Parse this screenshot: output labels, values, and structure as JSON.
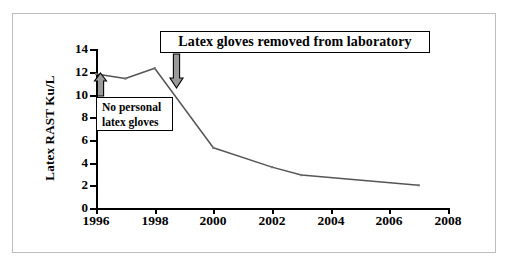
{
  "figure": {
    "background_color": "#ffffff",
    "frame_color": "#bdbdbd",
    "line_color": "#555555",
    "text_color": "#000000"
  },
  "annotations": {
    "removed": {
      "text": "Latex gloves removed from laboratory",
      "arrow": "down-arrow-icon",
      "year": 1999
    },
    "no_personal": {
      "line1": "No personal",
      "line2": "latex gloves",
      "arrow": "up-arrow-icon",
      "year": 1996
    }
  },
  "chart_data": {
    "type": "line",
    "title": "",
    "xlabel": "",
    "ylabel": "Latex RAST Ku/L",
    "x": [
      1996,
      1997,
      1998,
      2000,
      2002,
      2003,
      2007
    ],
    "values": [
      11.8,
      11.4,
      12.3,
      5.3,
      3.6,
      2.9,
      2.0
    ],
    "series": [
      {
        "name": "Latex RAST",
        "x": [
          1996,
          1997,
          1998,
          2000,
          2002,
          2003,
          2007
        ],
        "values": [
          11.8,
          11.4,
          12.3,
          5.3,
          3.6,
          2.9,
          2.0
        ]
      }
    ],
    "xlim": [
      1996,
      2008
    ],
    "ylim": [
      0,
      14
    ],
    "xticks": [
      1996,
      1998,
      2000,
      2002,
      2004,
      2006,
      2008
    ],
    "xtick_labels": [
      "1996",
      "1998",
      "2000",
      "2002",
      "2004",
      "2006",
      "2008"
    ],
    "yticks": [
      0,
      2,
      4,
      6,
      8,
      10,
      12,
      14
    ],
    "ytick_labels": [
      "0",
      "2",
      "4",
      "6",
      "8",
      "10",
      "12",
      "14"
    ],
    "grid": false,
    "legend": false,
    "marker": "small-tick",
    "annotations": [
      {
        "text": "Latex gloves removed from laboratory",
        "x": 1999,
        "y": 14
      },
      {
        "text": "No personal latex gloves",
        "x": 1996,
        "y": 10
      }
    ]
  }
}
